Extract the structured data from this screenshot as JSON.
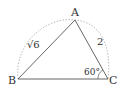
{
  "diagram": {
    "type": "triangle-inscribed",
    "vertices": {
      "A": {
        "label": "A",
        "x": 75,
        "y": 20
      },
      "B": {
        "label": "B",
        "x": 18,
        "y": 79
      },
      "C": {
        "label": "C",
        "x": 108,
        "y": 79
      }
    },
    "sides": {
      "AB": {
        "label": "√6"
      },
      "AC": {
        "label": "2"
      }
    },
    "angles": {
      "C": {
        "label": "60°"
      }
    },
    "colors": {
      "stroke": "#555555",
      "arc": "#999999",
      "text": "#333333"
    }
  }
}
